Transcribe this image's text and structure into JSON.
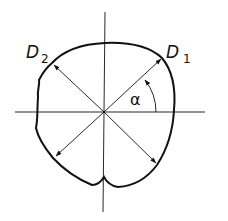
{
  "diagram": {
    "type": "cross-section measurement diagram",
    "labels": {
      "d1": "D",
      "d1_sub": "1",
      "d2": "D",
      "d2_sub": "2",
      "angle": "α"
    },
    "colors": {
      "stroke": "#111111",
      "background": "#ffffff"
    },
    "elements": [
      "irregular closed profile outline with notch at bottom",
      "horizontal center line (dash-dot)",
      "vertical center line (dash-dot)",
      "diameter D1 at angle α to horizontal, double-headed arrow",
      "diameter D2 perpendicular to D1, double-headed arrow",
      "angle arc α between horizontal axis and D1"
    ]
  }
}
